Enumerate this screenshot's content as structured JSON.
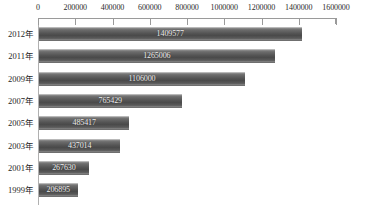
{
  "chart_data": {
    "type": "bar",
    "orientation": "horizontal",
    "title": "",
    "subtitle": "",
    "xlabel": "",
    "ylabel": "",
    "categories": [
      "2012年",
      "2011年",
      "2009年",
      "2007年",
      "2005年",
      "2003年",
      "2001年",
      "1999年"
    ],
    "values": [
      1409577,
      1265006,
      1106000,
      765429,
      485417,
      437014,
      267630,
      206895
    ],
    "value_labels": [
      "1409577",
      "1265006",
      "1106000",
      "765429",
      "485417",
      "437014",
      "267630",
      "206895"
    ],
    "series": [
      {
        "name": "",
        "values": [
          1409577,
          1265006,
          1106000,
          765429,
          485417,
          437014,
          267630,
          206895
        ]
      }
    ],
    "xlim": [
      0,
      1600000
    ],
    "xticks": [
      0,
      200000,
      400000,
      600000,
      800000,
      1000000,
      1200000,
      1400000,
      1600000
    ],
    "xtick_labels": [
      "0",
      "200000",
      "400000",
      "600000",
      "800000",
      "1000000",
      "1200000",
      "1400000",
      "1600000"
    ],
    "axis_position": "top",
    "grid": false,
    "legend": false,
    "bar_color": "#545454",
    "bar_label_color": "#f2f2f2",
    "axis_color": "#9a9a9a",
    "background": "#ffffff"
  }
}
